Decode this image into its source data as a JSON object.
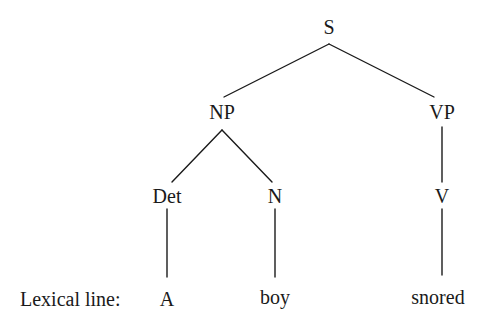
{
  "diagram": {
    "type": "syntax-tree",
    "lexical_line_label": "Lexical line:",
    "nodes": {
      "s": {
        "label": "S",
        "x": 329,
        "y": 27
      },
      "np": {
        "label": "NP",
        "x": 222,
        "y": 112
      },
      "vp": {
        "label": "VP",
        "x": 442,
        "y": 112
      },
      "det": {
        "label": "Det",
        "x": 167,
        "y": 196
      },
      "n": {
        "label": "N",
        "x": 275,
        "y": 196
      },
      "v": {
        "label": "V",
        "x": 442,
        "y": 196
      }
    },
    "words": {
      "a": {
        "label": "A",
        "x": 167,
        "y": 299
      },
      "boy": {
        "label": "boy",
        "x": 275,
        "y": 299
      },
      "snored": {
        "label": "snored",
        "x": 438,
        "y": 299
      }
    },
    "edges": [
      {
        "from": "S",
        "to": "NP"
      },
      {
        "from": "S",
        "to": "VP"
      },
      {
        "from": "NP",
        "to": "Det"
      },
      {
        "from": "NP",
        "to": "N"
      },
      {
        "from": "VP",
        "to": "V"
      },
      {
        "from": "Det",
        "to": "A"
      },
      {
        "from": "N",
        "to": "boy"
      },
      {
        "from": "V",
        "to": "snored"
      }
    ]
  }
}
